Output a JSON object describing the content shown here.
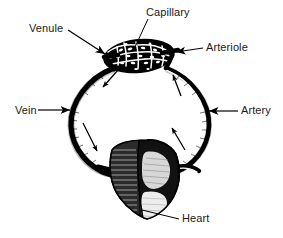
{
  "figure": {
    "background_color": "#ffffff",
    "ink_color": "#000000",
    "text_color": "#1a1a1a"
  },
  "labels": {
    "venule": "Venule",
    "capillary": "Capillary",
    "arteriole": "Arteriole",
    "vein": "Vein",
    "artery": "Artery",
    "heart": "Heart"
  },
  "structures": [
    {
      "name": "capillary-bed",
      "label": "Capillary",
      "description": "dark stippled oval network at top of the loop"
    },
    {
      "name": "venule",
      "label": "Venule",
      "description": "vessel leaving the left side of the capillary bed"
    },
    {
      "name": "arteriole",
      "label": "Arteriole",
      "description": "vessel entering the right side of the capillary bed"
    },
    {
      "name": "vein",
      "label": "Vein",
      "description": "thick dark vessel forming the left limb of the loop, carrying blood down toward the heart"
    },
    {
      "name": "artery",
      "label": "Artery",
      "description": "vessel forming the right limb of the loop, carrying blood up from the heart"
    },
    {
      "name": "heart",
      "label": "Heart",
      "description": "shaded anatomical heart at the bottom centre of the loop"
    }
  ],
  "flow_arrows": [
    {
      "name": "vein-flow-upper",
      "direction": "down-left",
      "side": "left"
    },
    {
      "name": "vein-flow-lower",
      "direction": "down-left",
      "side": "left"
    },
    {
      "name": "artery-flow-upper",
      "direction": "up-left",
      "side": "right"
    },
    {
      "name": "artery-flow-lower",
      "direction": "up-left",
      "side": "right"
    }
  ],
  "leader_lines": [
    {
      "name": "venule-leader",
      "from": "Venule",
      "to": "capillary-bed-left",
      "style": "tapered-arrow"
    },
    {
      "name": "capillary-leader",
      "from": "Capillary",
      "to": "capillary-bed-center",
      "style": "thin-line"
    },
    {
      "name": "arteriole-leader",
      "from": "Arteriole",
      "to": "capillary-bed-right",
      "style": "tapered-arrow"
    },
    {
      "name": "vein-leader",
      "from": "Vein",
      "to": "left-vessel",
      "style": "arrow-right"
    },
    {
      "name": "artery-leader",
      "from": "Artery",
      "to": "right-vessel",
      "style": "arrow-left"
    },
    {
      "name": "heart-leader",
      "from": "Heart",
      "to": "heart-apex",
      "style": "thin-line"
    }
  ]
}
